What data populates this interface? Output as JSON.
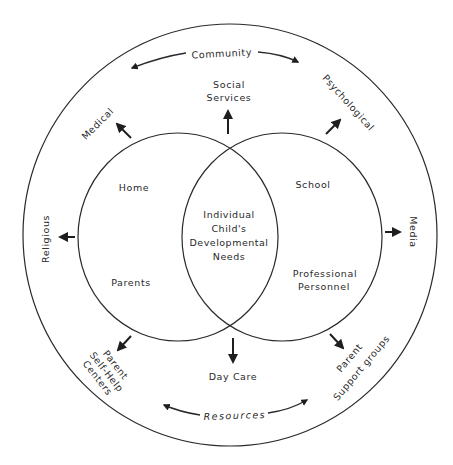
{
  "diagram": {
    "outer_ring": {
      "top_label": "Community",
      "bottom_label": "Resources"
    },
    "left_circle": {
      "top_label": "Home",
      "bottom_label": "Parents"
    },
    "right_circle": {
      "top_label": "School",
      "bottom_label_line1": "Professional",
      "bottom_label_line2": "Personnel"
    },
    "center": {
      "line1": "Individual",
      "line2": "Child's",
      "line3": "Developmental",
      "line4": "Needs"
    },
    "outward_nodes": {
      "social_services_line1": "Social",
      "social_services_line2": "Services",
      "medical": "Medical",
      "psychological": "Psychological",
      "religious": "Religious",
      "media": "Media",
      "parent_self_help_line1": "Parent",
      "parent_self_help_line2": "Self-Help",
      "parent_self_help_line3": "Centers",
      "day_care": "Day Care",
      "parent_support_line1": "Parent",
      "parent_support_line2": "Support groups"
    },
    "colors": {
      "line": "#2a2a2a",
      "background": "#ffffff"
    }
  }
}
